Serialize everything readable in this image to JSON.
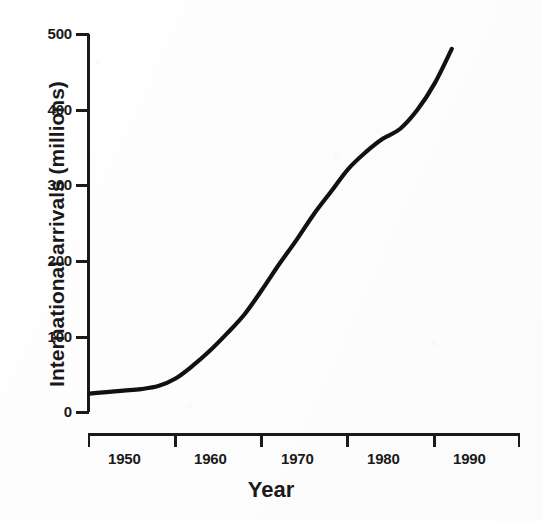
{
  "chart_data": {
    "type": "line",
    "title": "",
    "xlabel": "Year",
    "ylabel": "International arrivals (millions)",
    "xlim": [
      1948,
      1993
    ],
    "ylim": [
      0,
      500
    ],
    "grid": false,
    "legend": "none",
    "x_tick_labels": [
      "1950",
      "1960",
      "1970",
      "1980",
      "1990"
    ],
    "x_ticks": [
      1950,
      1960,
      1970,
      1980,
      1990
    ],
    "y_tick_labels": [
      "0",
      "100",
      "200",
      "300",
      "400",
      "500"
    ],
    "y_ticks": [
      0,
      100,
      200,
      300,
      400,
      500
    ],
    "series": [
      {
        "name": "International arrivals",
        "color": "#111111",
        "x": [
          1950,
          1952,
          1954,
          1956,
          1958,
          1960,
          1962,
          1964,
          1966,
          1968,
          1970,
          1972,
          1974,
          1976,
          1978,
          1980,
          1982,
          1984,
          1986,
          1988,
          1990,
          1992
        ],
        "values": [
          25,
          27,
          29,
          31,
          35,
          45,
          62,
          82,
          105,
          130,
          162,
          196,
          228,
          262,
          292,
          322,
          344,
          362,
          375,
          400,
          435,
          481
        ]
      }
    ],
    "annotations": []
  },
  "axis": {
    "line_color": "#1a1a1a",
    "tick_direction": "outward"
  }
}
